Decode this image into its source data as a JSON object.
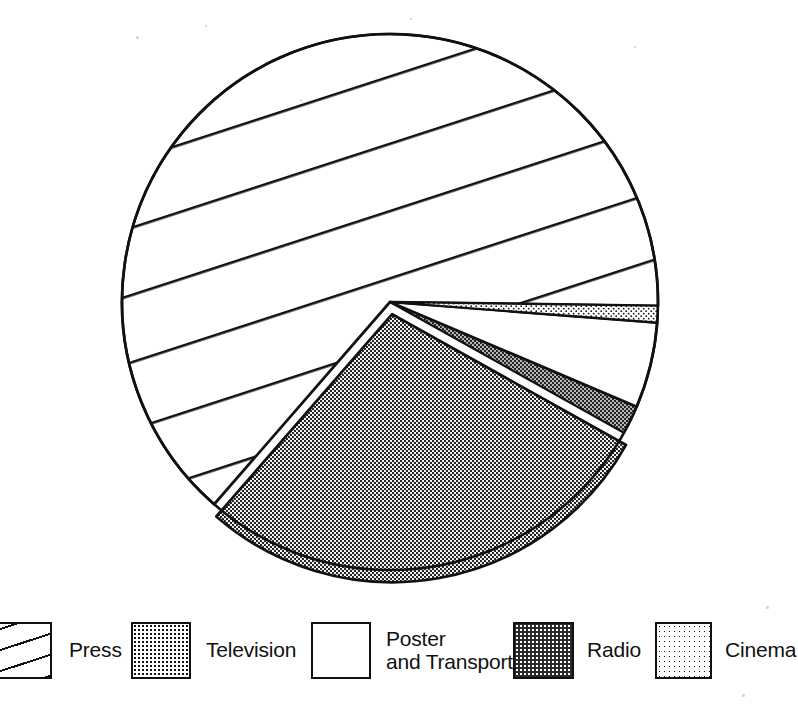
{
  "chart_data": {
    "type": "pie",
    "title": "",
    "subtitle": "",
    "xlabel": "",
    "ylabel": "",
    "grid": false,
    "legend_position": "bottom",
    "exploded_slice": "Television",
    "start_angle_deg": 0,
    "direction": "clockwise",
    "categories": [
      "Cinema",
      "Poster and Transport",
      "Radio",
      "Television",
      "Press"
    ],
    "values": [
      1,
      5,
      1.7,
      28.3,
      64
    ],
    "units": "percent",
    "slices": [
      {
        "label": "Cinema",
        "value": 1,
        "angle_deg": 3.6,
        "start_deg": 0.8,
        "end_deg": 4.4,
        "pattern": "light-dots",
        "color": "#ffffff",
        "exploded": false
      },
      {
        "label": "Poster and Transport",
        "value": 5,
        "angle_deg": 18.6,
        "start_deg": 4.4,
        "end_deg": 23.0,
        "pattern": "solid-white",
        "color": "#ffffff",
        "exploded": false
      },
      {
        "label": "Radio",
        "value": 1.7,
        "angle_deg": 6.2,
        "start_deg": 23.0,
        "end_deg": 29.2,
        "pattern": "dark-dots",
        "color": "#2a2a2a",
        "exploded": false
      },
      {
        "label": "Television",
        "value": 28.3,
        "angle_deg": 101.8,
        "start_deg": 29.2,
        "end_deg": 131.0,
        "pattern": "medium-dots",
        "color": "#9a9a9a",
        "exploded": true
      },
      {
        "label": "Press",
        "value": 64,
        "angle_deg": 229.8,
        "start_deg": 131.0,
        "end_deg": 360.8,
        "pattern": "diagonal-hatch",
        "color": "#ffffff",
        "exploded": false
      }
    ]
  },
  "legend": {
    "items": [
      {
        "label": "Press",
        "pattern": "diagonal-hatch"
      },
      {
        "label": "Television",
        "pattern": "medium-dots"
      },
      {
        "label": "Poster\nand Transport",
        "pattern": "solid-white"
      },
      {
        "label": "Radio",
        "pattern": "dark-dots"
      },
      {
        "label": "Cinema",
        "pattern": "light-dots"
      }
    ]
  },
  "colors": {
    "ink": "#111111",
    "paper": "#ffffff",
    "dark_fill": "#2a2a2a"
  }
}
